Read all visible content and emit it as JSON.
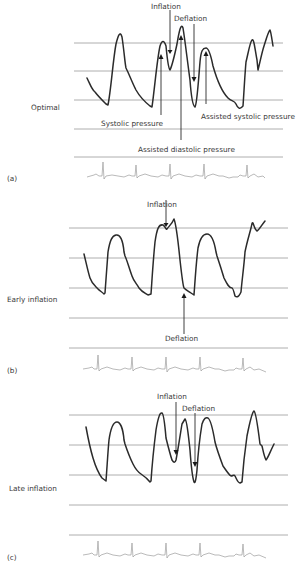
{
  "figure": {
    "panels": [
      {
        "id": "a",
        "tag": "(a)",
        "condition": "Optimal",
        "annotations": {
          "inflation": "Inflation",
          "deflation": "Deflation",
          "systolic": "Systolic pressure",
          "assisted_systolic": "Assisted systolic pressure",
          "assisted_diastolic": "Assisted diastolic pressure"
        }
      },
      {
        "id": "b",
        "tag": "(b)",
        "condition": "Early inflation",
        "annotations": {
          "inflation": "Inflation",
          "deflation": "Deflation"
        }
      },
      {
        "id": "c",
        "tag": "(c)",
        "condition": "Late inflation",
        "annotations": {
          "inflation": "Inflation",
          "deflation": "Deflation"
        }
      }
    ],
    "colors": {
      "waveform": "#2b2b2b",
      "gridline": "#9a9a9a",
      "ecg": "#9c9c9c",
      "text": "#3a3a3a"
    }
  }
}
